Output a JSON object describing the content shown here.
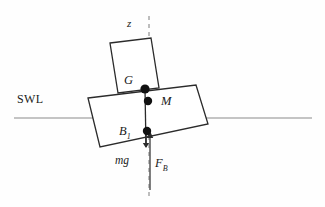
{
  "figure": {
    "type": "naval-architecture-stability-diagram",
    "background_color": "#fefefe",
    "line_color": "#2b2b2b",
    "waterline_color": "#8a8a8a",
    "dash_color": "#7d7d7d",
    "marker_color": "#111111"
  },
  "labels": {
    "swl": "SWL",
    "axis_z": "z",
    "point_g": "G",
    "point_m": "M",
    "point_b": "B",
    "point_b_sub": "1",
    "force_weight": "mg",
    "force_buoyancy": "F",
    "force_buoyancy_sub": "B"
  },
  "geometry": {
    "canvas": {
      "width": 325,
      "height": 207
    },
    "waterline": {
      "x1": 14,
      "y1": 118,
      "x2": 312,
      "y2": 118
    },
    "vertical_axis": {
      "x": 149,
      "y1": 16,
      "y2": 196,
      "dash": "4 4"
    },
    "hull": {
      "points": "88,98 196,85 208,124 100,147",
      "label": "heeled hull rectangle"
    },
    "superstructure": {
      "points": "110,43 151,38 159,88 118,93",
      "label": "tilted deckhouse rectangle"
    },
    "centerline_segment": {
      "x1": 145,
      "y1": 89,
      "x2": 146,
      "y2": 147
    },
    "markers": [
      {
        "name": "G",
        "cx": 145,
        "cy": 89,
        "r": 4.6
      },
      {
        "name": "M",
        "cx": 148,
        "cy": 101,
        "r": 4.2
      },
      {
        "name": "B1",
        "cx": 147,
        "cy": 131,
        "r": 4.2
      }
    ],
    "weight_arrow": {
      "x": 146,
      "y1": 131,
      "y2": 148
    },
    "buoyancy_arrow": {
      "x": 150,
      "y1": 190,
      "y2": 131
    }
  },
  "label_positions": {
    "swl": {
      "left": 17,
      "top": 93
    },
    "axis_z": {
      "left": 127,
      "top": 18
    },
    "point_g": {
      "left": 124,
      "top": 74
    },
    "point_m": {
      "left": 161,
      "top": 95
    },
    "point_b": {
      "left": 119,
      "top": 125
    },
    "force_weight": {
      "left": 115,
      "top": 155
    },
    "force_buoyancy": {
      "left": 155,
      "top": 157
    }
  }
}
